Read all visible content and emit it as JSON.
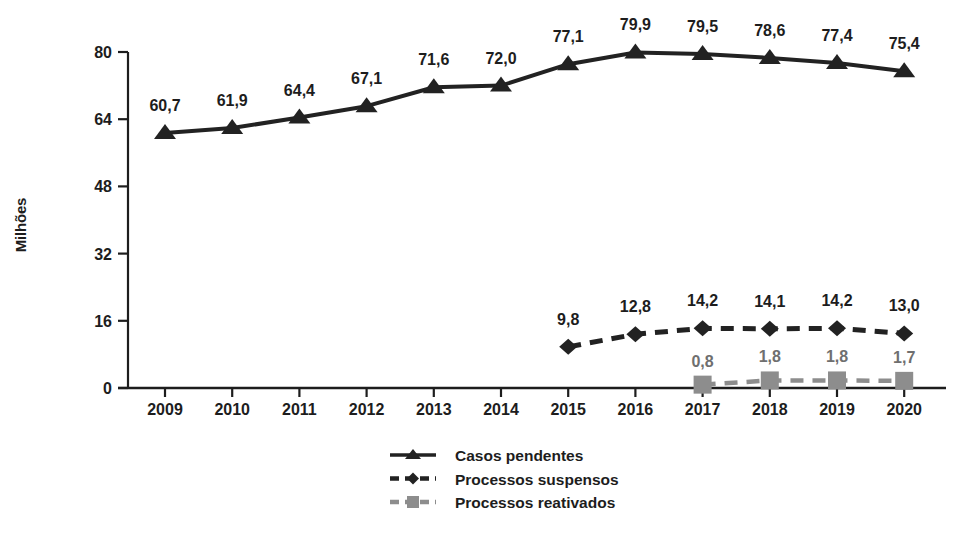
{
  "chart_data": {
    "type": "line",
    "title": "",
    "xlabel": "",
    "ylabel": "Milhões",
    "categories": [
      "2009",
      "2010",
      "2011",
      "2012",
      "2013",
      "2014",
      "2015",
      "2016",
      "2017",
      "2018",
      "2019",
      "2020"
    ],
    "ylim": [
      0,
      80
    ],
    "yticks": [
      "0",
      "16",
      "32",
      "48",
      "64",
      "80"
    ],
    "ytick_values": [
      0,
      16,
      32,
      48,
      64,
      80
    ],
    "grid": false,
    "legend_position": "bottom-center",
    "decimal_separator": ",",
    "series": [
      {
        "name": "Casos pendentes",
        "marker": "triangle",
        "line_style": "solid",
        "color": "#222222",
        "values": [
          60.7,
          61.9,
          64.4,
          67.1,
          71.6,
          72.0,
          77.1,
          79.9,
          79.5,
          78.6,
          77.4,
          75.4
        ],
        "labels": [
          "60,7",
          "61,9",
          "64,4",
          "67,1",
          "71,6",
          "72,0",
          "77,1",
          "79,9",
          "79,5",
          "78,6",
          "77,4",
          "75,4"
        ]
      },
      {
        "name": "Processos suspensos",
        "marker": "diamond",
        "line_style": "dashed",
        "color": "#222222",
        "values": [
          null,
          null,
          null,
          null,
          null,
          null,
          9.8,
          12.8,
          14.2,
          14.1,
          14.2,
          13.0
        ],
        "labels": [
          null,
          null,
          null,
          null,
          null,
          null,
          "9,8",
          "12,8",
          "14,2",
          "14,1",
          "14,2",
          "13,0"
        ]
      },
      {
        "name": "Processos reativados",
        "marker": "square",
        "line_style": "dashed",
        "color": "#8d8d8d",
        "values": [
          null,
          null,
          null,
          null,
          null,
          null,
          null,
          null,
          0.8,
          1.8,
          1.8,
          1.7
        ],
        "labels": [
          null,
          null,
          null,
          null,
          null,
          null,
          null,
          null,
          "0,8",
          "1,8",
          "1,8",
          "1,7"
        ]
      }
    ]
  },
  "legend": {
    "items": [
      {
        "label": "Casos pendentes"
      },
      {
        "label": "Processos suspensos"
      },
      {
        "label": "Processos reativados"
      }
    ]
  }
}
